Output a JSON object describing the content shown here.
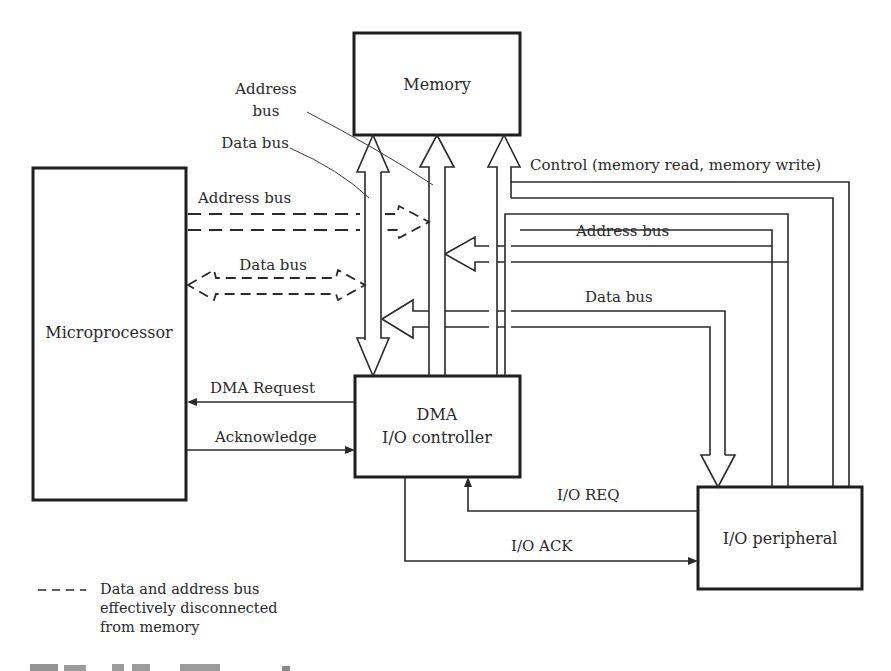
{
  "blocks": {
    "memory": "Memory",
    "microprocessor": "Microprocessor",
    "dma_line1": "DMA",
    "dma_line2": "I/O controller",
    "peripheral": "I/O peripheral"
  },
  "labels": {
    "address_bus_callout_1": "Address",
    "address_bus_callout_2": "bus",
    "data_bus_callout": "Data bus",
    "cpu_address_bus": "Address  bus",
    "cpu_data_bus": "Data bus",
    "control_bus": "Control (memory read, memory write)",
    "periph_address_bus": "Address bus",
    "periph_data_bus": "Data bus",
    "dma_request": "DMA  Request",
    "acknowledge": "Acknowledge",
    "io_req": "I/O REQ",
    "io_ack": "I/O ACK"
  },
  "legend": {
    "symbol": "— — —",
    "line1": "Data and address bus",
    "line2": "effectively disconnected",
    "line3": "from memory"
  },
  "colors": {
    "ink": "#2a2a2a",
    "background": "#ffffff"
  }
}
